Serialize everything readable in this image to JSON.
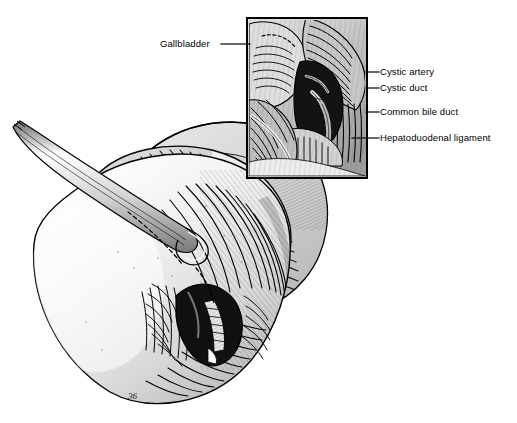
{
  "figure": {
    "kind": "anatomical-illustration",
    "style": "pen-and-ink line drawing with cross-hatching, grayscale",
    "background_color": "#ffffff",
    "ink_color": "#000000"
  },
  "labels": {
    "gallbladder": "Gallbladder",
    "cystic_artery": "Cystic artery",
    "cystic_duct": "Cystic duct",
    "common_bile_duct": "Common bile duct",
    "hepatoduodenal_ligament": "Hepatoduodenal ligament"
  },
  "inset": {
    "name": "magnified-detail-box",
    "x": 247,
    "y": 18,
    "width": 120,
    "height": 160,
    "border_color": "#000000",
    "border_width": 2
  },
  "leaders": [
    {
      "name": "gallbladder",
      "x1": 221,
      "y1": 44,
      "x2": 249,
      "y2": 44,
      "side": "left"
    },
    {
      "name": "cystic-artery",
      "x1": 367,
      "y1": 72,
      "x2": 380,
      "y2": 72,
      "side": "right"
    },
    {
      "name": "cystic-duct",
      "x1": 367,
      "y1": 88,
      "x2": 380,
      "y2": 88,
      "side": "right"
    },
    {
      "name": "common-bile-duct",
      "x1": 367,
      "y1": 112,
      "x2": 380,
      "y2": 112,
      "side": "right"
    },
    {
      "name": "hepatoduodenal-ligament",
      "x1": 356,
      "y1": 138,
      "x2": 380,
      "y2": 138,
      "side": "right"
    }
  ],
  "elements": {
    "instrument": "surgical grasper shaft entering from upper-left",
    "gallbladder_body": "large smooth fundus occupying left and lower portion",
    "liver_surface": "cross-hatched hepatic surface upper-right of gallbladder",
    "calot_triangle_cavity": "dark dissected cavity in lower-center",
    "artist_signature": "36"
  }
}
